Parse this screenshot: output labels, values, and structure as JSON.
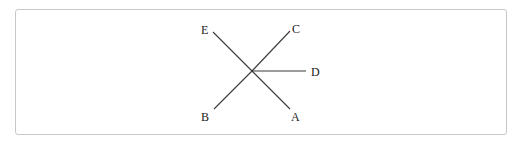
{
  "diagram": {
    "type": "geometry-rays",
    "center": {
      "x": 252,
      "y": 71
    },
    "rays": [
      {
        "id": "E",
        "label": "E",
        "end": {
          "x": 213,
          "y": 32
        },
        "label_pos": {
          "x": 205,
          "y": 34
        }
      },
      {
        "id": "C",
        "label": "C",
        "end": {
          "x": 290,
          "y": 31
        },
        "label_pos": {
          "x": 294,
          "y": 33
        }
      },
      {
        "id": "D",
        "label": "D",
        "end": {
          "x": 306,
          "y": 71
        },
        "label_pos": {
          "x": 314,
          "y": 76
        }
      },
      {
        "id": "B",
        "label": "B",
        "end": {
          "x": 214,
          "y": 109
        },
        "label_pos": {
          "x": 205,
          "y": 120
        }
      },
      {
        "id": "A",
        "label": "A",
        "end": {
          "x": 290,
          "y": 109
        },
        "label_pos": {
          "x": 295,
          "y": 120
        }
      }
    ],
    "colors": {
      "line": "#3a3a3a",
      "text": "#222222",
      "border": "#c8c8c8"
    }
  }
}
